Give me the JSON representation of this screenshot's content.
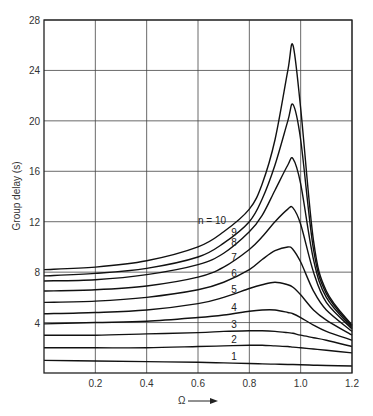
{
  "chart_data": {
    "type": "line",
    "title": "",
    "xlabel": "Ω",
    "ylabel": "Group delay (s)",
    "xlim": [
      0,
      1.2
    ],
    "ylim": [
      0,
      28
    ],
    "x_ticks": [
      "0.2",
      "0.4",
      "0.6",
      "0.8",
      "1.0",
      "1.2"
    ],
    "y_ticks": [
      "4",
      "8",
      "12",
      "16",
      "20",
      "24",
      "28"
    ],
    "grid": true,
    "legend": "inline curve labels",
    "label_prefix": "n = ",
    "x": [
      0,
      0.2,
      0.4,
      0.6,
      0.7,
      0.8,
      0.85,
      0.9,
      0.95,
      0.97,
      1.0,
      1.05,
      1.1,
      1.2
    ],
    "series": [
      {
        "name": "1",
        "values": [
          1.0,
          0.95,
          0.9,
          0.85,
          0.8,
          0.75,
          0.72,
          0.7,
          0.68,
          0.67,
          0.65,
          0.62,
          0.6,
          0.55
        ]
      },
      {
        "name": "2",
        "values": [
          2.0,
          2.0,
          2.0,
          2.1,
          2.15,
          2.2,
          2.2,
          2.15,
          2.1,
          2.05,
          2.0,
          1.9,
          1.8,
          1.6
        ]
      },
      {
        "name": "3",
        "values": [
          3.0,
          3.0,
          3.1,
          3.2,
          3.3,
          3.35,
          3.35,
          3.3,
          3.2,
          3.15,
          3.0,
          2.8,
          2.6,
          2.1
        ]
      },
      {
        "name": "4",
        "values": [
          3.9,
          4.0,
          4.1,
          4.4,
          4.6,
          4.9,
          5.0,
          5.0,
          4.8,
          4.7,
          4.4,
          3.8,
          3.3,
          2.6
        ]
      },
      {
        "name": "5",
        "values": [
          4.7,
          4.8,
          5.0,
          5.5,
          6.0,
          6.7,
          7.0,
          7.2,
          7.0,
          6.8,
          6.2,
          5.0,
          4.2,
          3.0
        ]
      },
      {
        "name": "6",
        "values": [
          5.6,
          5.7,
          6.0,
          6.6,
          7.2,
          8.2,
          9.0,
          9.7,
          10.0,
          9.8,
          8.8,
          6.5,
          5.0,
          3.3
        ]
      },
      {
        "name": "7",
        "values": [
          6.5,
          6.6,
          6.9,
          7.6,
          8.4,
          9.8,
          10.8,
          12.0,
          13.0,
          13.1,
          11.8,
          8.0,
          5.6,
          3.5
        ]
      },
      {
        "name": "8",
        "values": [
          7.3,
          7.4,
          7.8,
          8.6,
          9.5,
          11.2,
          12.5,
          14.5,
          16.5,
          17.0,
          15.0,
          9.0,
          6.0,
          3.6
        ]
      },
      {
        "name": "9",
        "values": [
          7.7,
          7.9,
          8.3,
          9.2,
          10.3,
          12.0,
          13.8,
          16.5,
          20.0,
          21.3,
          18.5,
          9.8,
          6.3,
          3.7
        ]
      },
      {
        "name": "10",
        "values": [
          8.2,
          8.4,
          8.9,
          10.0,
          11.2,
          13.0,
          15.0,
          18.5,
          24.0,
          26.0,
          21.0,
          10.5,
          6.5,
          3.8
        ]
      }
    ]
  }
}
